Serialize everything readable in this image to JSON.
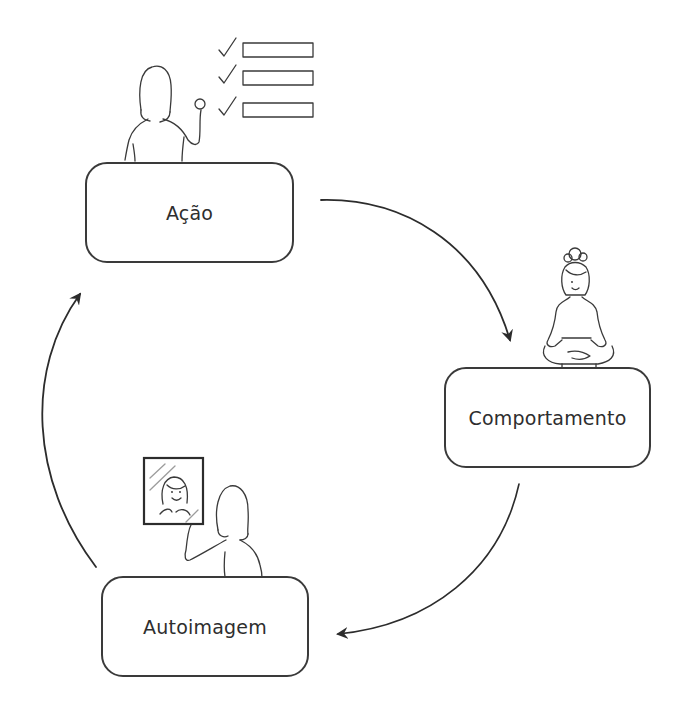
{
  "diagram": {
    "type": "cycle",
    "nodes": [
      {
        "id": "acao",
        "label": "Ação",
        "illustration": "woman-raising-fist-with-checklist"
      },
      {
        "id": "comportamento",
        "label": "Comportamento",
        "illustration": "woman-meditating-lotus-pose"
      },
      {
        "id": "autoimagem",
        "label": "Autoimagem",
        "illustration": "woman-looking-at-mirror"
      }
    ],
    "edges": [
      {
        "from": "acao",
        "to": "comportamento"
      },
      {
        "from": "comportamento",
        "to": "autoimagem"
      },
      {
        "from": "autoimagem",
        "to": "acao"
      }
    ],
    "checklist_items": 3
  },
  "colors": {
    "ink": "#2c2c2c",
    "background": "#ffffff"
  }
}
